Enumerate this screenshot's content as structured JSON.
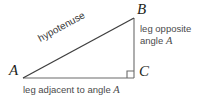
{
  "figure": {
    "background_color": "#ffffff",
    "stroke_color": "#3f3f3f",
    "text_color": "#4a4a4a",
    "vertex_text_color": "#231f20"
  },
  "vertices": {
    "a": "A",
    "b": "B",
    "c": "C"
  },
  "labels": {
    "hypotenuse": "hypotenuse",
    "opposite_line1": "leg opposite",
    "opposite_line2_prefix": "angle ",
    "opposite_line2_angle": "A",
    "adjacent_prefix": "leg adjacent to angle ",
    "adjacent_angle": "A"
  },
  "geometry": {
    "point_a": [
      23,
      78
    ],
    "point_b": [
      134,
      18
    ],
    "point_c": [
      134,
      78
    ],
    "right_angle_marker_size": 7
  }
}
